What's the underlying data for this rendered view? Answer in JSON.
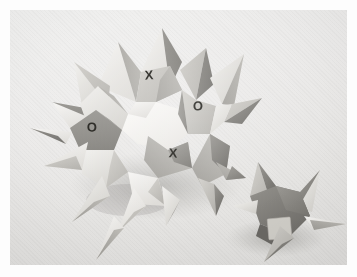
{
  "photo": {
    "subject": "modular-origami-spiky-polyhedron",
    "description": "Photograph of a folded-paper spiky polyhedron (stellated dodecahedron-like model) on a pale gray backdrop, with a second smaller detached spiked unit at the lower right.",
    "background_color": "#ecebea",
    "border_color": "#ffffff",
    "plate": {
      "left": 10,
      "top": 10,
      "width": 337,
      "height": 255
    }
  },
  "labels": {
    "face_marks": [
      {
        "id": "mark-x-top",
        "text": "X",
        "x": 139,
        "y": 65,
        "size": 13,
        "rotate": -4
      },
      {
        "id": "mark-o-right",
        "text": "O",
        "x": 188,
        "y": 96,
        "size": 13,
        "rotate": 2
      },
      {
        "id": "mark-o-left",
        "text": "O",
        "x": 82,
        "y": 117,
        "size": 13,
        "rotate": -2
      },
      {
        "id": "mark-x-bottom",
        "text": "X",
        "x": 163,
        "y": 143,
        "size": 13,
        "rotate": 3
      }
    ],
    "patch": {
      "id": "square-patch",
      "x": 258,
      "y": 208,
      "width": 23,
      "height": 21,
      "color": "#cfcdc7"
    }
  },
  "palette": {
    "paper_lightest": "#f4f3f1",
    "paper_light": "#e2e1de",
    "paper_mid": "#c6c5c0",
    "paper_mid_dark": "#a9a8a3",
    "paper_dark": "#8b8a85",
    "paper_darkest": "#6f6e6a",
    "shadow": "rgba(90,90,86,0.30)",
    "glyph_ink": "#15140f"
  },
  "counts": {
    "visible_spikes": 18,
    "marked_faces": 4,
    "detached_units": 1
  }
}
